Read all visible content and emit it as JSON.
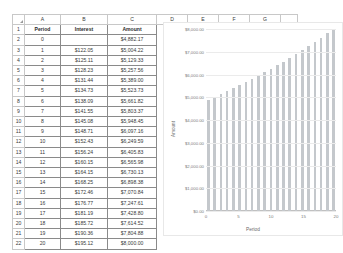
{
  "sheet": {
    "column_headers": [
      "A",
      "B",
      "C",
      "D",
      "E",
      "F",
      "G"
    ],
    "row_numbers": [
      "1",
      "2",
      "3",
      "4",
      "5",
      "6",
      "7",
      "8",
      "9",
      "10",
      "11",
      "12",
      "13",
      "14",
      "15",
      "16",
      "17",
      "18",
      "19",
      "20",
      "21",
      "22"
    ],
    "table_headers": [
      "Period",
      "Interest",
      "Amount"
    ],
    "rows": [
      {
        "period": "0",
        "interest": "",
        "amount": "$4,882.17"
      },
      {
        "period": "1",
        "interest": "$122.05",
        "amount": "$5,004.22"
      },
      {
        "period": "2",
        "interest": "$125.11",
        "amount": "$5,129.33"
      },
      {
        "period": "3",
        "interest": "$128.23",
        "amount": "$5,257.56"
      },
      {
        "period": "4",
        "interest": "$131.44",
        "amount": "$5,389.00"
      },
      {
        "period": "5",
        "interest": "$134.73",
        "amount": "$5,523.73"
      },
      {
        "period": "6",
        "interest": "$138.09",
        "amount": "$5,661.82"
      },
      {
        "period": "7",
        "interest": "$141.55",
        "amount": "$5,803.37"
      },
      {
        "period": "8",
        "interest": "$145.08",
        "amount": "$5,948.45"
      },
      {
        "period": "9",
        "interest": "$148.71",
        "amount": "$6,097.16"
      },
      {
        "period": "10",
        "interest": "$152.43",
        "amount": "$6,249.59"
      },
      {
        "period": "11",
        "interest": "$156.24",
        "amount": "$6,405.83"
      },
      {
        "period": "12",
        "interest": "$160.15",
        "amount": "$6,565.98"
      },
      {
        "period": "13",
        "interest": "$164.15",
        "amount": "$6,730.13"
      },
      {
        "period": "14",
        "interest": "$168.25",
        "amount": "$6,898.38"
      },
      {
        "period": "15",
        "interest": "$172.46",
        "amount": "$7,070.84"
      },
      {
        "period": "16",
        "interest": "$176.77",
        "amount": "$7,247.61"
      },
      {
        "period": "17",
        "interest": "$181.19",
        "amount": "$7,428.80"
      },
      {
        "period": "18",
        "interest": "$185.72",
        "amount": "$7,614.52"
      },
      {
        "period": "19",
        "interest": "$190.36",
        "amount": "$7,804.88"
      },
      {
        "period": "20",
        "interest": "$195.12",
        "amount": "$8,000.00"
      }
    ]
  },
  "chart_data": {
    "type": "bar",
    "title": "",
    "xlabel": "Period",
    "ylabel": "Amount",
    "categories": [
      0,
      1,
      2,
      3,
      4,
      5,
      6,
      7,
      8,
      9,
      10,
      11,
      12,
      13,
      14,
      15,
      16,
      17,
      18,
      19,
      20
    ],
    "values": [
      4882.17,
      5004.22,
      5129.33,
      5257.56,
      5389.0,
      5523.73,
      5661.82,
      5803.37,
      5948.45,
      6097.16,
      6249.59,
      6405.83,
      6565.98,
      6730.13,
      6898.38,
      7070.84,
      7247.61,
      7428.8,
      7614.52,
      7804.88,
      8000.0
    ],
    "ylim": [
      0,
      8000
    ],
    "ytick_labels": [
      "$8,000.00",
      "$7,000.00",
      "$6,000.00",
      "$5,000.00",
      "$4,000.00",
      "$3,000.00",
      "$2,000.00",
      "$1,000.00",
      "$0.00"
    ],
    "ytick_values": [
      8000,
      7000,
      6000,
      5000,
      4000,
      3000,
      2000,
      1000,
      0
    ],
    "xtick_labels": [
      "0",
      "5",
      "10",
      "15",
      "20"
    ],
    "xtick_values": [
      0,
      5,
      10,
      15,
      20
    ],
    "grid": true,
    "legend": false,
    "bar_color": "#c4c8cc"
  }
}
